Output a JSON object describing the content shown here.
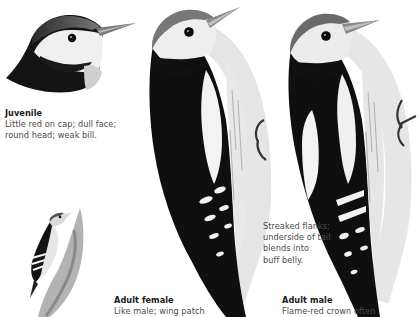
{
  "page": {
    "palette": {
      "ink": "#111111",
      "mid": "#8a8a8a",
      "light": "#d8d8d8",
      "paper": "#ffffff"
    }
  },
  "illustrations": [
    {
      "id": "juvenile-head",
      "label": "Juvenile head portrait"
    },
    {
      "id": "small-perched",
      "label": "Small woodpecker on trunk"
    },
    {
      "id": "adult-female",
      "label": "Adult female woodpecker"
    },
    {
      "id": "adult-male",
      "label": "Adult male woodpecker"
    }
  ],
  "captions": {
    "juvenile": {
      "title": "Juvenile",
      "lines": [
        "Little red on cap; dull face;",
        "round head; weak bill."
      ]
    },
    "flanks": {
      "lines": [
        "Streaked flanks;",
        "underside of tail",
        "blends into",
        "buff belly."
      ]
    },
    "female": {
      "title": "Adult female",
      "lines": [
        "Like male; wing patch"
      ]
    },
    "male": {
      "title": "Adult male",
      "lines": [
        "Flame-red crown often"
      ]
    }
  }
}
